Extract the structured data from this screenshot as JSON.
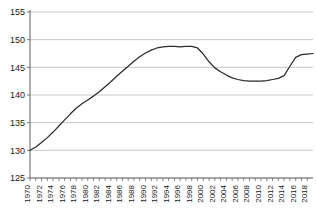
{
  "chart_data": {
    "type": "line",
    "title": "",
    "subtitle": "",
    "xlabel": "",
    "ylabel": "",
    "grid": true,
    "legend": false,
    "legend_position": "none",
    "ylim": [
      125,
      155
    ],
    "ytick_step": 5,
    "ytick_labels": [
      "155",
      "150",
      "145",
      "140",
      "135",
      "130",
      "125"
    ],
    "ytick_values": [
      155,
      150,
      145,
      140,
      135,
      130,
      125
    ],
    "xlim": [
      1970,
      2019
    ],
    "xtick_step": 1,
    "xlabel_step": 2,
    "xtick_labels": [
      "1970",
      "1972",
      "1974",
      "1976",
      "1978",
      "1980",
      "1982",
      "1984",
      "1986",
      "1988",
      "1990",
      "1992",
      "1994",
      "1996",
      "1998",
      "2000",
      "2002",
      "2004",
      "2006",
      "2008",
      "2010",
      "2012",
      "2014",
      "2016",
      "2018"
    ],
    "x": [
      1970,
      1971,
      1972,
      1973,
      1974,
      1975,
      1976,
      1977,
      1978,
      1979,
      1980,
      1981,
      1982,
      1983,
      1984,
      1985,
      1986,
      1987,
      1988,
      1989,
      1990,
      1991,
      1992,
      1993,
      1994,
      1995,
      1996,
      1997,
      1998,
      1999,
      2000,
      2001,
      2002,
      2003,
      2004,
      2005,
      2006,
      2007,
      2008,
      2009,
      2010,
      2011,
      2012,
      2013,
      2014,
      2015,
      2016,
      2017,
      2018,
      2019
    ],
    "values": [
      130.0,
      130.6,
      131.4,
      132.3,
      133.3,
      134.4,
      135.5,
      136.6,
      137.6,
      138.4,
      139.1,
      139.8,
      140.6,
      141.5,
      142.4,
      143.4,
      144.3,
      145.2,
      146.1,
      146.9,
      147.6,
      148.1,
      148.5,
      148.7,
      148.8,
      148.8,
      148.7,
      148.8,
      148.8,
      148.5,
      147.4,
      146.0,
      144.9,
      144.2,
      143.6,
      143.1,
      142.8,
      142.6,
      142.5,
      142.5,
      142.5,
      142.6,
      142.8,
      143.0,
      143.5,
      145.2,
      146.8,
      147.3,
      147.4,
      147.5
    ],
    "series": [
      {
        "name": "series-1",
        "color": "#2b2b2b",
        "values": [
          130.0,
          130.6,
          131.4,
          132.3,
          133.3,
          134.4,
          135.5,
          136.6,
          137.6,
          138.4,
          139.1,
          139.8,
          140.6,
          141.5,
          142.4,
          143.4,
          144.3,
          145.2,
          146.1,
          146.9,
          147.6,
          148.1,
          148.5,
          148.7,
          148.8,
          148.8,
          148.7,
          148.8,
          148.8,
          148.5,
          147.4,
          146.0,
          144.9,
          144.2,
          143.6,
          143.1,
          142.8,
          142.6,
          142.5,
          142.5,
          142.5,
          142.6,
          142.8,
          143.0,
          143.5,
          145.2,
          146.8,
          147.3,
          147.4,
          147.5
        ]
      }
    ],
    "annotations": []
  },
  "colors": {
    "line": "#2b2b2b",
    "grid": "#b9b9b9",
    "axis": "#6d6d6d",
    "background": "#ffffff",
    "text": "#1a1a1a"
  }
}
